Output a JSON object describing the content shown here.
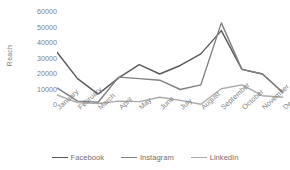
{
  "chart_data": {
    "type": "line",
    "title": "",
    "xlabel": "",
    "ylabel": "Reach",
    "ylim": [
      0,
      60000
    ],
    "yticks": [
      60000,
      50000,
      40000,
      30000,
      20000,
      10000,
      0
    ],
    "ytick_labels": [
      "60000",
      "50000",
      "40000",
      "30000",
      "20000",
      "10000",
      "0"
    ],
    "grid": false,
    "legend_position": "bottom",
    "categories": [
      "January",
      "February",
      "March",
      "April",
      "May",
      "June",
      "July",
      "August",
      "September",
      "October",
      "November",
      "December"
    ],
    "series": [
      {
        "name": "Facebook",
        "color": "#595959",
        "values": [
          34000,
          17000,
          7000,
          17500,
          26000,
          20000,
          25500,
          33000,
          48000,
          23000,
          20000,
          8000
        ]
      },
      {
        "name": "Instagram",
        "color": "#808080",
        "values": [
          11000,
          2500,
          1800,
          18000,
          17000,
          16000,
          10000,
          13000,
          53000,
          23000,
          20000,
          8000
        ]
      },
      {
        "name": "LinkedIn",
        "color": "#aaaaaa",
        "values": [
          6500,
          1500,
          1000,
          2500,
          2200,
          5000,
          3000,
          500,
          10500,
          13000,
          6000,
          5000
        ]
      }
    ]
  },
  "legend": {
    "items": [
      {
        "label": "Facebook"
      },
      {
        "label": "Instagram"
      },
      {
        "label": "LinkedIn"
      }
    ]
  }
}
